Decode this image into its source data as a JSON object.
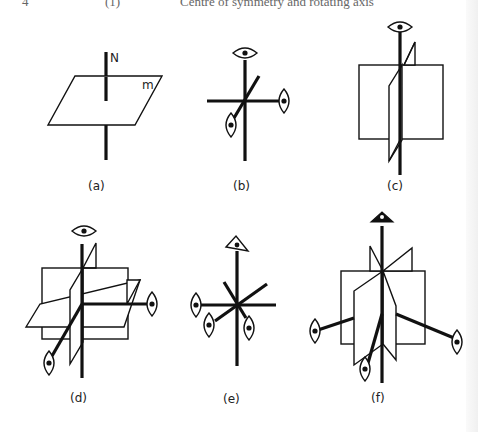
{
  "header": {
    "page_number": "4",
    "section": "(1)",
    "title": "Centre of symmetry and rotating axis"
  },
  "figure": {
    "panels": [
      {
        "id": "a",
        "label": "(a)",
        "annotations": {
          "axis": "N",
          "plane": "m"
        },
        "description": "Mirror plane m with normal N"
      },
      {
        "id": "b",
        "label": "(b)",
        "description": "Three orthogonal 2-fold axes"
      },
      {
        "id": "c",
        "label": "(c)",
        "description": "2-fold axis with two mirror planes"
      },
      {
        "id": "d",
        "label": "(d)",
        "description": "Three 2-fold axes with three mirror planes"
      },
      {
        "id": "e",
        "label": "(e)",
        "description": "3-fold axis with three 2-fold axes"
      },
      {
        "id": "f",
        "label": "(f)",
        "description": "3-fold axis with three 2-fold axes and mirror planes"
      }
    ],
    "symbols": {
      "two_fold": "lens-ellipse-with-dot",
      "three_fold": "triangle-with-dot"
    },
    "colors": {
      "ink": "#111111",
      "paper": "#ffffff"
    }
  }
}
